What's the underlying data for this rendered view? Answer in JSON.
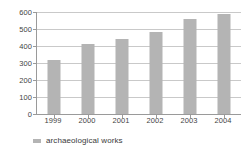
{
  "chart_data": {
    "type": "bar",
    "title": "",
    "subtitle": "",
    "xlabel": "",
    "ylabel": "",
    "categories": [
      "1999",
      "2000",
      "2001",
      "2002",
      "2003",
      "2004"
    ],
    "values": [
      318,
      412,
      440,
      480,
      558,
      590
    ],
    "series": [
      {
        "name": "archaeological works",
        "values": [
          318,
          412,
          440,
          480,
          558,
          590
        ],
        "color": "#b4b4b4"
      }
    ],
    "ylim": [
      0,
      600
    ],
    "ytick_step": 100,
    "ytick_labels": [
      "600",
      "500",
      "400",
      "300",
      "200",
      "100",
      "0"
    ],
    "ytick_values": [
      600,
      500,
      400,
      300,
      200,
      100,
      0
    ],
    "grid": true,
    "grid_axis": "y",
    "legend": {
      "position": "bottom-left",
      "entries": [
        {
          "label": "archaeological works",
          "color": "#b4b4b4",
          "marker": "square-swatch"
        }
      ]
    },
    "colors": {
      "bar": "#b4b4b4",
      "grid": "#c9c9c9",
      "axis": "#9a9a9a",
      "text": "#444444",
      "background": "#ffffff"
    }
  }
}
